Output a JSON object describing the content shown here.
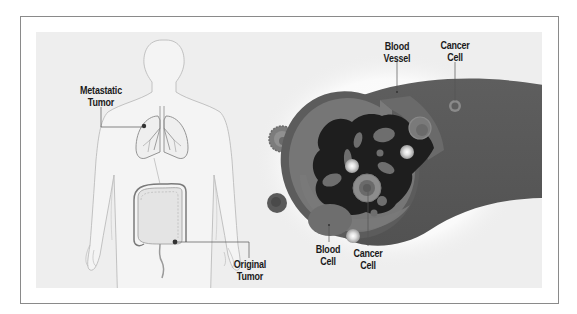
{
  "diagram": {
    "labels": {
      "metastatic_tumor": "Metastatic\nTumor",
      "original_tumor": "Original\nTumor",
      "blood_vessel": "Blood\nVessel",
      "cancer_cell_top": "Cancer\nCell",
      "blood_cell": "Blood\nCell",
      "cancer_cell_bottom": "Cancer\nCell"
    },
    "label_lines": {
      "metastatic_tumor": [
        "Metastatic",
        "Tumor"
      ],
      "original_tumor": [
        "Original",
        "Tumor"
      ],
      "blood_vessel": [
        "Blood",
        "Vessel"
      ],
      "cancer_cell_top": [
        "Cancer",
        "Cell"
      ],
      "blood_cell": [
        "Blood",
        "Cell"
      ],
      "cancer_cell_bottom": [
        "Cancer",
        "Cell"
      ]
    },
    "colors": {
      "background": "#eeeeee",
      "frame_border": "#8a8a8a",
      "vessel_outer": "#5a5a5a",
      "vessel_wall": "#6e6e6e",
      "vessel_lumen": "#1c1c1c",
      "body_outline": "#b5b5b5",
      "label_text": "#1a1a1a",
      "leader_line": "#555555"
    }
  }
}
